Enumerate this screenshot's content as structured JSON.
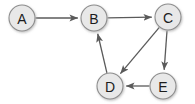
{
  "diagram": {
    "type": "directed-graph",
    "background_color": "#ffffff",
    "node_fill_color": "#e8e8e8",
    "node_stroke_color": "#8e8e8e",
    "node_label_color": "#1c1c1c",
    "edge_color": "#5a5a5a",
    "node_radius": 13,
    "nodes": [
      {
        "id": "A",
        "label": "A",
        "cx": 22,
        "cy": 18
      },
      {
        "id": "B",
        "label": "B",
        "cx": 94,
        "cy": 18
      },
      {
        "id": "C",
        "label": "C",
        "cx": 168,
        "cy": 17
      },
      {
        "id": "D",
        "label": "D",
        "cx": 110,
        "cy": 86
      },
      {
        "id": "E",
        "label": "E",
        "cx": 163,
        "cy": 86
      }
    ],
    "edges": [
      {
        "id": "A-B",
        "from": "A",
        "to": "B",
        "directed": true
      },
      {
        "id": "B-C",
        "from": "B",
        "to": "C",
        "directed": true
      },
      {
        "id": "C-D",
        "from": "C",
        "to": "D",
        "directed": true
      },
      {
        "id": "C-E",
        "from": "C",
        "to": "E",
        "directed": true
      },
      {
        "id": "E-D",
        "from": "E",
        "to": "D",
        "directed": true
      },
      {
        "id": "D-B",
        "from": "D",
        "to": "B",
        "directed": true
      }
    ]
  }
}
